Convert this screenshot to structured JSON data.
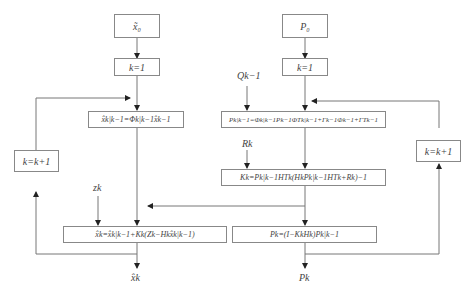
{
  "diagram": {
    "type": "Kalman filter flowchart",
    "left_column": {
      "init_box": "x̃₀",
      "k_init_box": "k=1",
      "predict_state_box": "x̂k|k−1=Φk|k−1x̂k−1",
      "update_state_box": "x̂k=x̂k|k−1+Kk(Zk−Hkx̂k|k−1)",
      "loop_box": "k=k+1",
      "measurement_input": "zk",
      "output": "x̂k"
    },
    "right_column": {
      "init_box": "P₀",
      "k_init_box": "k=1",
      "predict_cov_box": "Pk|k−1=Φk|k−1Pk−1ΦTk|k−1+Γk−1Φk−1+ΓTk−1",
      "gain_box": "Kk=Pk|k−1HTk(HkPk|k−1HTk+Rk)−1",
      "update_cov_box": "Pk=(I−KkHk)Pk|k−1",
      "loop_box": "k=k+1",
      "process_noise_input": "Qk−1",
      "measurement_noise_input": "Rk",
      "output": "Pk"
    },
    "colors": {
      "line": "#777777",
      "box_border": "#888888",
      "text": "#444444"
    }
  }
}
